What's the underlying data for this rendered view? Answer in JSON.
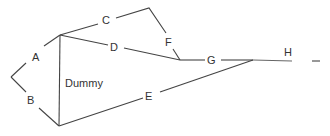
{
  "diagram": {
    "type": "activity-network",
    "line_color": "#444444",
    "label_color": "#333333",
    "labels": {
      "A": "A",
      "B": "B",
      "C": "C",
      "D": "D",
      "E": "E",
      "F": "F",
      "G": "G",
      "H": "H",
      "dummy": "Dummy"
    },
    "activities": [
      {
        "name": "A",
        "from": "start",
        "to": "node-2"
      },
      {
        "name": "B",
        "from": "start",
        "to": "node-3"
      },
      {
        "name": "C",
        "from": "node-2",
        "to": "node-4"
      },
      {
        "name": "D",
        "from": "node-2",
        "to": "node-5"
      },
      {
        "name": "Dummy",
        "from": "node-2",
        "to": "node-3"
      },
      {
        "name": "E",
        "from": "node-3",
        "to": "node-6"
      },
      {
        "name": "F",
        "from": "node-4",
        "to": "node-5"
      },
      {
        "name": "G",
        "from": "node-5",
        "to": "node-6"
      },
      {
        "name": "H",
        "from": "node-6",
        "to": "end"
      }
    ]
  }
}
